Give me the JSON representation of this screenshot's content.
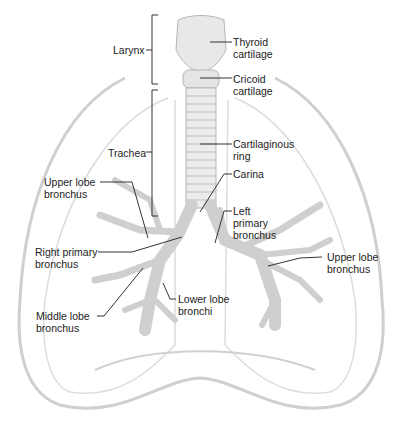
{
  "labels": {
    "larynx": [
      "Larynx"
    ],
    "thyroid": [
      "Thyroid",
      "cartilage"
    ],
    "cricoid": [
      "Cricoid",
      "cartilage"
    ],
    "trachea": [
      "Trachea"
    ],
    "cart_ring": [
      "Cartilaginous",
      "ring"
    ],
    "carina": [
      "Carina"
    ],
    "upper_lobe_r": [
      "Upper lobe",
      "bronchus"
    ],
    "left_primary": [
      "Left",
      "primary",
      "bronchus"
    ],
    "right_primary": [
      "Right primary",
      "bronchus"
    ],
    "upper_lobe_l": [
      "Upper lobe",
      "bronchus"
    ],
    "lower_lobe": [
      "Lower lobe",
      "bronchi"
    ],
    "middle_lobe": [
      "Middle lobe",
      "bronchus"
    ]
  },
  "colors": {
    "outline": "#c8c8c8",
    "tissue": "#d9d9d9",
    "text": "#222222",
    "leader": "#333333"
  }
}
